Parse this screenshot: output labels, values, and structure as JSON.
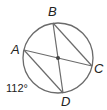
{
  "diagram": {
    "type": "circle-inscribed-chords",
    "circle": {
      "cx": 58,
      "cy": 58,
      "r": 35,
      "stroke": "#6b6b6b"
    },
    "points": {
      "A": {
        "label": "A",
        "x": 24,
        "y": 50
      },
      "B": {
        "label": "B",
        "x": 53,
        "y": 23
      },
      "C": {
        "label": "C",
        "x": 92,
        "y": 66
      },
      "D": {
        "label": "D",
        "x": 63,
        "y": 93
      }
    },
    "center": {
      "x": 58,
      "y": 58
    },
    "chords": [
      "AC",
      "BD",
      "BC",
      "AD"
    ],
    "arc_label": {
      "text": "112°",
      "arc": "AD"
    }
  }
}
